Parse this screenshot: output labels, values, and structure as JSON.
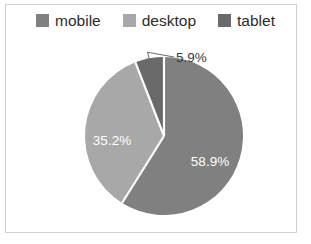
{
  "figure": {
    "background": "#ffffff",
    "frame_color": "#cfcfcf"
  },
  "legend": {
    "position": "top",
    "items": [
      {
        "label": "mobile",
        "color": "#808080",
        "swatch_name": "legend-swatch-mobile"
      },
      {
        "label": "desktop",
        "color": "#a8a8a8",
        "swatch_name": "legend-swatch-desktop"
      },
      {
        "label": "tablet",
        "color": "#6a6a6a",
        "swatch_name": "legend-swatch-tablet"
      }
    ]
  },
  "labels": {
    "mobile_pct": "58.9%",
    "desktop_pct": "35.2%",
    "tablet_pct": "5.9%"
  },
  "chart_data": {
    "type": "pie",
    "title": "",
    "categories": [
      "mobile",
      "desktop",
      "tablet"
    ],
    "values": [
      58.9,
      35.2,
      5.9
    ],
    "value_labels": [
      "58.9%",
      "35.2%",
      "5.9%"
    ],
    "colors": [
      "#808080",
      "#a8a8a8",
      "#6a6a6a"
    ],
    "units": "percent",
    "total": 100.0,
    "start_angle_deg": 90,
    "direction": "clockwise",
    "legend": {
      "position": "top",
      "entries": [
        "mobile",
        "desktop",
        "tablet"
      ]
    },
    "label_placement": [
      "inside",
      "inside",
      "outside-callout"
    ],
    "grid": false,
    "xlabel": "",
    "ylabel": ""
  },
  "geometry": {
    "center_x": 164,
    "center_y": 136,
    "radius": 79
  }
}
